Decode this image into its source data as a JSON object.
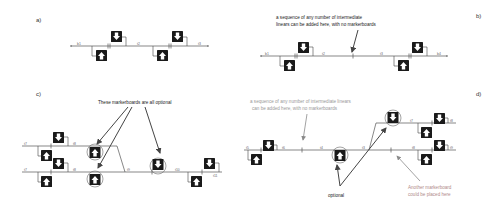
{
  "panels": {
    "a": {
      "label": "a)",
      "tracks": [
        "b1",
        "t2",
        "t3"
      ]
    },
    "b": {
      "label": "b)",
      "annotation_line1": "a sequence of any number of intermediate",
      "annotation_line2": "linears can be added here, with no markerboards",
      "tracks": [
        "b1",
        "t2",
        "t3",
        "b4"
      ]
    },
    "c": {
      "label": "c)",
      "annotation": "These markerboards are all optional",
      "tracks": [
        "t7",
        "t8",
        "t7",
        "t8",
        "t9",
        "t10",
        "t11"
      ]
    },
    "d": {
      "label": "d)",
      "annotation_top_line1": "a sequence of any number of intermediate linears",
      "annotation_top_line2": "can be added here, with no markerboards",
      "annotation_optional": "optional",
      "annotation_another_line1": "Another markerboard",
      "annotation_another_line2": "could be placed here",
      "tracks": [
        "t5",
        "t6",
        "t4",
        "t3",
        "t7",
        "t8",
        "t8",
        "t9"
      ]
    }
  },
  "icons": {
    "markerboard_down": "markerboard-down-arrow-icon",
    "markerboard_up": "markerboard-up-arrow-icon"
  },
  "colors": {
    "track": "#555555",
    "markerboard": "#1a1a1a",
    "annotation_dark": "#222222",
    "annotation_light": "#9a9a9a",
    "annotation_rose": "#b08a8a"
  }
}
